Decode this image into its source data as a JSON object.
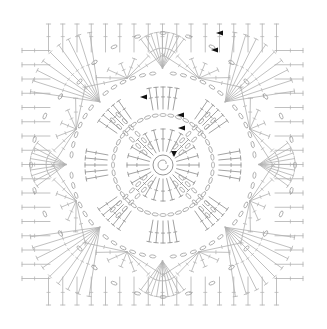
{
  "diagram": {
    "type": "crochet-chart",
    "canvas": {
      "width": 327,
      "height": 329,
      "background": "#ffffff"
    },
    "square": {
      "x": 20,
      "y": 22,
      "size": 285,
      "corner_radius": 22
    },
    "center": {
      "x": 163,
      "y": 165
    },
    "colors": {
      "stitch": "#8a8a8a",
      "stitch_light": "#b0b0b0",
      "chain": "#999999",
      "marker": "#111111"
    },
    "center_ring": {
      "radius": 10,
      "spiral": true
    },
    "rounds": [
      {
        "name": "round-1",
        "radius_inner": 14,
        "radius_outer": 36,
        "stitch": "dc",
        "count": 24
      },
      {
        "name": "round-2",
        "radius": 50,
        "stitch": "chain-arc",
        "count": 8
      },
      {
        "name": "round-3",
        "radius_inner": 56,
        "radius_outer": 78,
        "stitch": "dc-group",
        "count": 8
      },
      {
        "name": "round-4",
        "radius": 92,
        "stitch": "chain-arc",
        "count": 16
      },
      {
        "name": "round-5",
        "radius": 110,
        "stitch": "fan",
        "count": 8
      }
    ],
    "diagonal_petals": 4,
    "border": {
      "stitches_per_side": 20,
      "corner_fans": 4
    },
    "markers": [
      {
        "x": 219,
        "y": 33,
        "dir": "left"
      },
      {
        "x": 214,
        "y": 50,
        "dir": "left"
      },
      {
        "x": 143,
        "y": 97,
        "dir": "left"
      },
      {
        "x": 180,
        "y": 115,
        "dir": "left"
      },
      {
        "x": 181,
        "y": 128,
        "dir": "left"
      },
      {
        "x": 174,
        "y": 154,
        "dir": "down"
      }
    ]
  }
}
